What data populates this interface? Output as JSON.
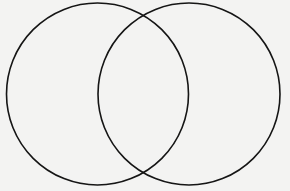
{
  "diagram": {
    "type": "venn",
    "background_color": "#f3f3f2",
    "stroke_color": "#151515",
    "sets": [
      {
        "id": "left",
        "label": "",
        "cx": 97.5,
        "cy": 94,
        "r": 91
      },
      {
        "id": "right",
        "label": "",
        "cx": 189,
        "cy": 94,
        "r": 91
      }
    ],
    "regions": {
      "left_only": "",
      "intersection": "",
      "right_only": ""
    }
  }
}
